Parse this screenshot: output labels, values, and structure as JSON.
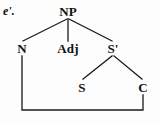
{
  "diagram": {
    "type": "syntax-tree",
    "example_label": "e'.",
    "stroke_color": "#1a1a1a",
    "text_color": "#111111",
    "background_color": "#fdfdfd",
    "nodes": [
      {
        "id": "np",
        "label": "NP",
        "x": 68,
        "y": 11,
        "level": 0
      },
      {
        "id": "n",
        "label": "N",
        "x": 22,
        "y": 48,
        "level": 1
      },
      {
        "id": "adj",
        "label": "Adj",
        "x": 68,
        "y": 48,
        "level": 1
      },
      {
        "id": "sbar",
        "label": "S'",
        "x": 113,
        "y": 48,
        "level": 1
      },
      {
        "id": "s",
        "label": "S",
        "x": 82,
        "y": 87,
        "level": 2
      },
      {
        "id": "c",
        "label": "C",
        "x": 143,
        "y": 87,
        "level": 2
      }
    ],
    "edges": [
      {
        "from": "np",
        "to": "n"
      },
      {
        "from": "np",
        "to": "adj"
      },
      {
        "from": "np",
        "to": "sbar"
      },
      {
        "from": "sbar",
        "to": "s"
      },
      {
        "from": "sbar",
        "to": "c"
      }
    ],
    "coindex_link": {
      "from": "n",
      "to": "c",
      "shape": "bracket-below",
      "bottom_y": 110
    }
  }
}
